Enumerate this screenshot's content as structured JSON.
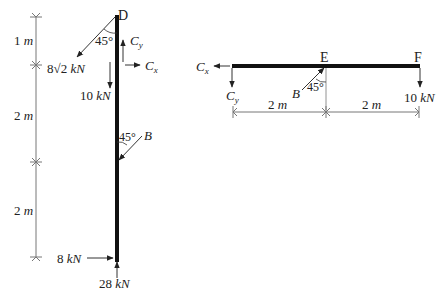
{
  "left_member": {
    "top_label": "D",
    "dimensions": [
      {
        "label": "1 m",
        "value": "1",
        "unit": "m"
      },
      {
        "label": "2 m",
        "value": "2",
        "unit": "m"
      },
      {
        "label": "2 m",
        "value": "2",
        "unit": "m"
      }
    ],
    "force_diag": {
      "value": "8√2",
      "unit": "kN",
      "angle": "45°"
    },
    "force_down": {
      "value": "10",
      "unit": "kN"
    },
    "cy_label": "C",
    "cy_sub": "y",
    "cx_label": "C",
    "cx_sub": "x",
    "b_label": "B",
    "b_angle": "45°",
    "bottom_horizontal": {
      "value": "8",
      "unit": "kN"
    },
    "bottom_vertical": {
      "value": "28",
      "unit": "kN"
    }
  },
  "right_member": {
    "e_label": "E",
    "f_label": "F",
    "cx_label": "C",
    "cx_sub": "x",
    "cy_label": "C",
    "cy_sub": "y",
    "b_label": "B",
    "b_angle": "45°",
    "force_f": {
      "value": "10",
      "unit": "kN"
    },
    "dimensions": [
      {
        "label": "2 m",
        "value": "2",
        "unit": "m"
      },
      {
        "label": "2 m",
        "value": "2",
        "unit": "m"
      }
    ]
  }
}
